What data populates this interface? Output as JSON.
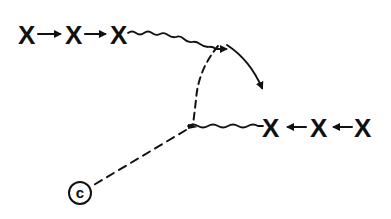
{
  "diagram": {
    "top_chain": {
      "nodes": [
        {
          "label": "X",
          "x": 28,
          "y": 34
        },
        {
          "label": "X",
          "x": 75,
          "y": 34
        },
        {
          "label": "X",
          "x": 120,
          "y": 34
        }
      ],
      "arrow_direction": "right"
    },
    "bottom_chain": {
      "nodes": [
        {
          "label": "X",
          "x": 272,
          "y": 127
        },
        {
          "label": "X",
          "x": 320,
          "y": 127
        },
        {
          "label": "X",
          "x": 364,
          "y": 127
        }
      ],
      "arrow_direction": "left"
    },
    "circle_node": {
      "label": "c",
      "x": 80,
      "y": 193
    },
    "edges": [
      {
        "type": "wavy-arrow",
        "from": "top_chain.2",
        "to": "upper-junction"
      },
      {
        "type": "dashed",
        "from": "upper-junction",
        "to": "lower-junction"
      },
      {
        "type": "curved-arrow",
        "from": "upper-junction",
        "to": "bottom_chain"
      },
      {
        "type": "wavy",
        "from": "lower-junction",
        "to": "bottom_chain.0"
      },
      {
        "type": "dashed",
        "from": "lower-junction",
        "to": "circle_node"
      }
    ],
    "colors": {
      "ink": "#111111",
      "background": "#ffffff"
    }
  }
}
